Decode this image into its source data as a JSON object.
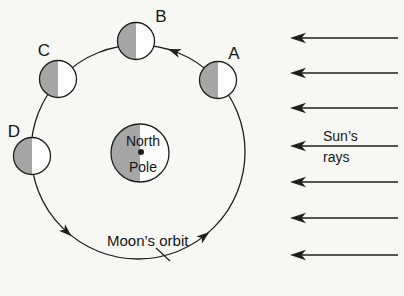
{
  "diagram": {
    "background": "#f7f7f4",
    "line_color": "#1e1e1e",
    "shade_color": "#a6a6a6",
    "body_fill": "#fdfdfd",
    "orbit": {
      "label": "Moon’s orbit",
      "cx": 138,
      "cy": 152,
      "r": 107,
      "direction": "counterclockwise",
      "arrow_angles_deg": [
        70,
        228,
        308
      ],
      "label_x": 107,
      "label_y": 246,
      "leader": {
        "x1": 156,
        "y1": 248,
        "x2": 170,
        "y2": 261
      }
    },
    "earth": {
      "line1": "North",
      "line2": "Pole",
      "cx": 140,
      "cy": 153,
      "r": 29,
      "dot_r": 3,
      "text_x": 143,
      "line1_y": 146,
      "line2_y": 172,
      "shaded_side": "left"
    },
    "moon_r": 18.5,
    "moons": [
      {
        "label": "A",
        "cx": 218,
        "cy": 80,
        "lx": 234,
        "ly": 59,
        "shaded_side": "left"
      },
      {
        "label": "B",
        "cx": 136,
        "cy": 41,
        "lx": 161,
        "ly": 22,
        "shaded_side": "left"
      },
      {
        "label": "C",
        "cx": 58,
        "cy": 79,
        "lx": 44,
        "ly": 56,
        "shaded_side": "left"
      },
      {
        "label": "D",
        "cx": 32,
        "cy": 156,
        "lx": 14,
        "ly": 137,
        "shaded_side": "left"
      }
    ],
    "sun_rays": {
      "line1": "Sun’s",
      "line2": "rays",
      "label_x": 323,
      "line1_y": 141,
      "line2_y": 162,
      "x_tail": 398,
      "x_tip": 290,
      "ys": [
        38,
        73,
        108,
        146,
        182,
        218,
        255
      ],
      "direction": "pointing-left"
    }
  }
}
